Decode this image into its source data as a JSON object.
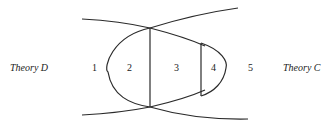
{
  "diagram": {
    "left_label": "Theory D",
    "right_label": "Theory C",
    "regions": [
      "1",
      "2",
      "3",
      "4",
      "5"
    ]
  }
}
